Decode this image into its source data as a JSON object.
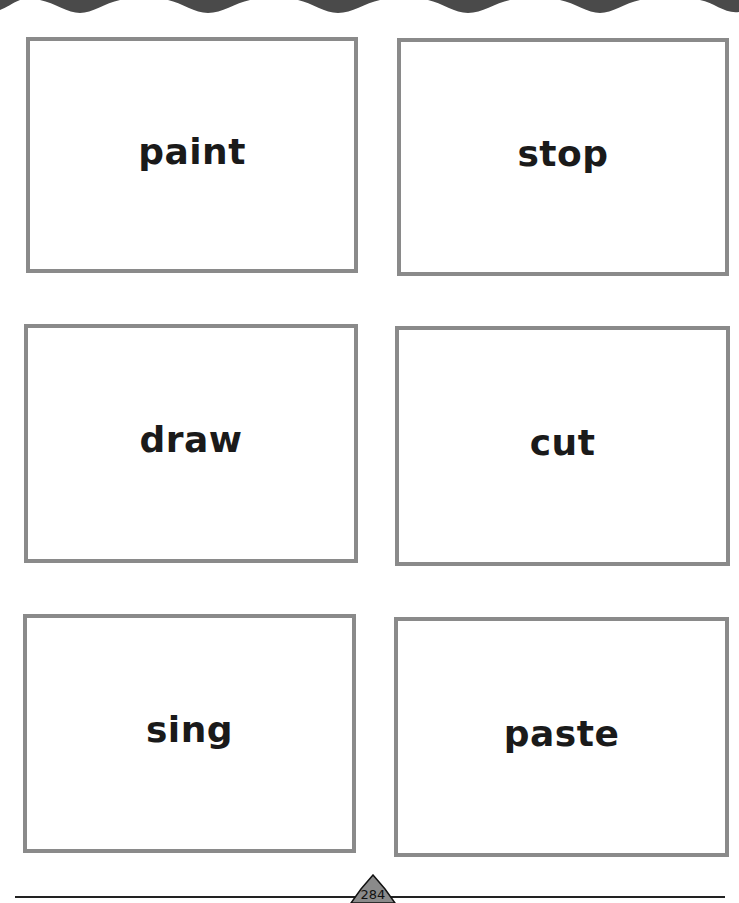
{
  "page": {
    "header_decoration": "scalloped-wave-border",
    "border_color": "#8a8a8a",
    "header_color": "#4a4a4a"
  },
  "cards": [
    {
      "word": "paint"
    },
    {
      "word": "stop"
    },
    {
      "word": "draw"
    },
    {
      "word": "cut"
    },
    {
      "word": "sing"
    },
    {
      "word": "paste"
    }
  ],
  "footer": {
    "page_number": "284"
  }
}
